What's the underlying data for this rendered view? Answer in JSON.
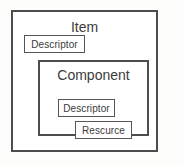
{
  "diagram": {
    "type": "nested-containment-boxes",
    "background_color": "#fdfdfc",
    "line_color": "#4d4d4d",
    "text_color": "#3b3b3b",
    "outer": {
      "title": "Item",
      "children": [
        {
          "label": "Descriptor"
        }
      ],
      "inner": {
        "title": "Component",
        "children": [
          {
            "label": "Descriptor"
          },
          {
            "label": "Rescurce"
          }
        ]
      }
    }
  }
}
